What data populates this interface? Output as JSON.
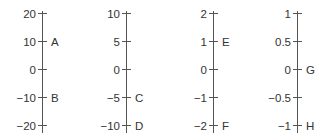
{
  "axes": [
    {
      "id": "axis-1",
      "x": 42,
      "ticks": [
        {
          "label": "20",
          "y": 14
        },
        {
          "label": "10",
          "y": 42
        },
        {
          "label": "0",
          "y": 70
        },
        {
          "label": "−10",
          "y": 98
        },
        {
          "label": "−20",
          "y": 126
        }
      ],
      "points": [
        {
          "label": "A",
          "y": 42
        },
        {
          "label": "B",
          "y": 98
        }
      ]
    },
    {
      "id": "axis-2",
      "x": 126,
      "ticks": [
        {
          "label": "10",
          "y": 14
        },
        {
          "label": "5",
          "y": 42
        },
        {
          "label": "0",
          "y": 70
        },
        {
          "label": "−5",
          "y": 98
        },
        {
          "label": "−10",
          "y": 126
        }
      ],
      "points": [
        {
          "label": "C",
          "y": 98
        },
        {
          "label": "D",
          "y": 126
        }
      ]
    },
    {
      "id": "axis-3",
      "x": 213,
      "ticks": [
        {
          "label": "2",
          "y": 14
        },
        {
          "label": "1",
          "y": 42
        },
        {
          "label": "0",
          "y": 70
        },
        {
          "label": "−1",
          "y": 98
        },
        {
          "label": "−2",
          "y": 126
        }
      ],
      "points": [
        {
          "label": "E",
          "y": 42
        },
        {
          "label": "F",
          "y": 126
        }
      ]
    },
    {
      "id": "axis-4",
      "x": 297,
      "ticks": [
        {
          "label": "1",
          "y": 14
        },
        {
          "label": "0.5",
          "y": 42
        },
        {
          "label": "0",
          "y": 70
        },
        {
          "label": "−0.5",
          "y": 98
        },
        {
          "label": "−1",
          "y": 126
        }
      ],
      "points": [
        {
          "label": "G",
          "y": 70
        },
        {
          "label": "H",
          "y": 126
        }
      ]
    }
  ]
}
